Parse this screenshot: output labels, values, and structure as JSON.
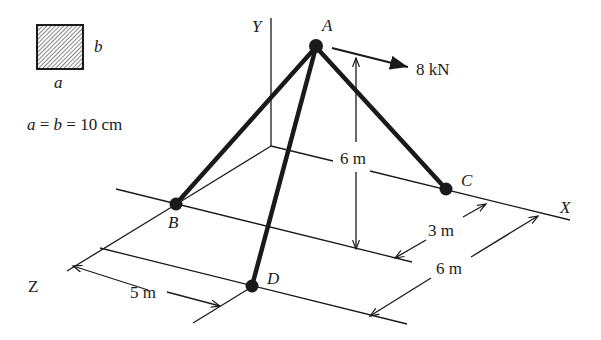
{
  "cross_section": {
    "width_label": "a",
    "height_label": "b",
    "dimension_text": "a = b = 10 cm",
    "eq_parts": [
      "a",
      " = ",
      "b",
      " = 10 cm"
    ]
  },
  "axes": {
    "x_label": "X",
    "y_label": "Y",
    "z_label": "Z"
  },
  "points": {
    "A": "A",
    "B": "B",
    "C": "C",
    "D": "D"
  },
  "load": {
    "value_text": "8 kN"
  },
  "dimensions": {
    "height_A": "6 m",
    "oc_distance": "6 m",
    "c_offset": "3 m",
    "x_span": "6 m",
    "z_span": "5 m"
  },
  "colors": {
    "ink": "#1a1a1a",
    "hatch": "#555555",
    "background": "#ffffff"
  }
}
